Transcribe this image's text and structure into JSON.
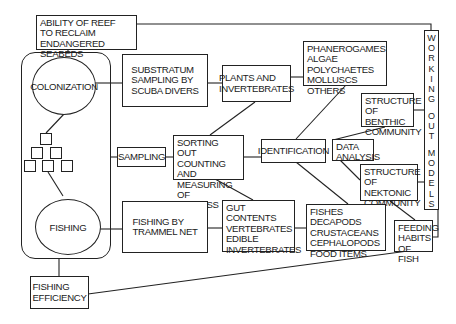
{
  "diagram": {
    "nodes": {
      "ability": "ABILITY OF REEF\nTO RECLAIM\nENDANGERED SEABEDS",
      "colonization": "COLONIZATION",
      "fishing": "FISHING",
      "substratum": "SUBSTRATUM\nSAMPLING BY\nSCUBA DIVERS",
      "plants": "PLANTS  AND\nINVERTEBRATES",
      "phanerogames": "PHANEROGAMES\nALGAE\nPOLYCHAETES\nMOLLUSCS OTHERS",
      "benthic": "STRUCTURE\nOF BENTHIC\nCOMMUNITY",
      "sampling": "SAMPLING",
      "sorting": "SORTING OUT\nCOUNTING AND\nMEASURING OF\nBIOMASS",
      "identification": "IDENTIFICATION",
      "data_analysis": "DATA\nANALYSIS",
      "nektonic": "STRUCTURE\nOF NEKTONIC\nCOMMUNITY",
      "trammel": "FISHING BY\nTRAMMEL NET",
      "gut": "GUT CONTENTS\nVERTEBRATES\nEDIBLE\nINVERTEBRATES",
      "fishes": "FISHES DECAPODS\nCRUSTACEANS\nCEPHALOPODS\nFOOD ITEMS",
      "feeding": "FEEDING\nHABITS\nOF FISH",
      "efficiency": "FISHING\nEFFICIENCY",
      "working_models": [
        "W",
        "O",
        "R",
        "K",
        "I",
        "N",
        "G",
        " ",
        "O",
        "U",
        "T",
        " ",
        "M",
        "O",
        "D",
        "E",
        "L",
        "S"
      ]
    }
  }
}
